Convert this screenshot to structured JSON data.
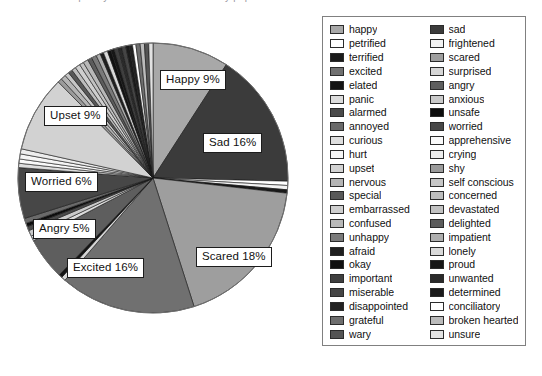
{
  "chart_data": {
    "type": "pie",
    "title": "Frequency of emotion words used by pupils",
    "legend_position": "right",
    "legend_columns": 2,
    "start_angle_deg": -90,
    "direction": "clockwise",
    "labels_shown": [
      {
        "name": "Happy 9%",
        "category": "happy",
        "value": 9
      },
      {
        "name": "Sad 16%",
        "category": "sad",
        "value": 16
      },
      {
        "name": "Scared 18%",
        "category": "scared",
        "value": 18
      },
      {
        "name": "Excited 16%",
        "category": "excited",
        "value": 16
      },
      {
        "name": "Angry 5%",
        "category": "angry",
        "value": 5
      },
      {
        "name": "Worried 6%",
        "category": "worried",
        "value": 6
      },
      {
        "name": "Upset 9%",
        "category": "upset",
        "value": 9
      }
    ],
    "categories": [
      "happy",
      "sad",
      "petrified",
      "frightened",
      "terrified",
      "scared",
      "excited",
      "surprised",
      "elated",
      "angry",
      "panic",
      "anxious",
      "alarmed",
      "unsafe",
      "annoyed",
      "worried",
      "curious",
      "apprehensive",
      "hurt",
      "crying",
      "upset",
      "shy",
      "nervous",
      "self conscious",
      "special",
      "concerned",
      "embarrassed",
      "devastated",
      "confused",
      "delighted",
      "unhappy",
      "impatient",
      "afraid",
      "lonely",
      "okay",
      "proud",
      "important",
      "unwanted",
      "miserable",
      "determined",
      "disappointed",
      "conciliatory",
      "grateful",
      "broken hearted",
      "wary",
      "unsure"
    ],
    "values": [
      9.0,
      16.0,
      0.5,
      0.5,
      0.4,
      18.0,
      16.0,
      0.5,
      0.4,
      5.0,
      0.6,
      0.7,
      0.5,
      0.4,
      0.6,
      6.0,
      0.5,
      0.5,
      0.6,
      0.6,
      9.0,
      0.5,
      0.6,
      0.5,
      0.5,
      0.5,
      0.6,
      0.5,
      0.6,
      0.5,
      0.6,
      0.5,
      0.4,
      0.5,
      0.4,
      0.4,
      0.5,
      0.4,
      0.5,
      0.4,
      0.4,
      0.4,
      0.5,
      0.5,
      0.5,
      0.5
    ],
    "colors": [
      "#a8a8a8",
      "#3b3b3b",
      "#ffffff",
      "#f2f2f2",
      "#1a1a1a",
      "#9e9e9e",
      "#707070",
      "#d6d6d6",
      "#141414",
      "#5e5e5e",
      "#dcdcdc",
      "#cacaca",
      "#4a4a4a",
      "#0d0d0d",
      "#6a6a6a",
      "#474747",
      "#dedede",
      "#fafafa",
      "#f5f5f5",
      "#ededed",
      "#d2d2d2",
      "#9b9b9b",
      "#b4b4b4",
      "#c6c6c6",
      "#585858",
      "#bdbdbd",
      "#cfcfcf",
      "#c2c2c2",
      "#b8b8b8",
      "#5c5c5c",
      "#7a7a7a",
      "#aeaeae",
      "#1f1f1f",
      "#d9d9d9",
      "#111111",
      "#171717",
      "#3f3f3f",
      "#2a2a2a",
      "#454545",
      "#1b1b1b",
      "#222222",
      "#ffffff",
      "#6e6e6e",
      "#bbbbbb",
      "#545454",
      "#e2e2e2"
    ]
  },
  "legend": {
    "left_column": [
      {
        "label": "happy",
        "color": "#a8a8a8"
      },
      {
        "label": "petrified",
        "color": "#ffffff"
      },
      {
        "label": "terrified",
        "color": "#1a1a1a"
      },
      {
        "label": "excited",
        "color": "#707070"
      },
      {
        "label": "elated",
        "color": "#141414"
      },
      {
        "label": "panic",
        "color": "#dcdcdc"
      },
      {
        "label": "alarmed",
        "color": "#4a4a4a"
      },
      {
        "label": "annoyed",
        "color": "#6a6a6a"
      },
      {
        "label": "curious",
        "color": "#dedede"
      },
      {
        "label": "hurt",
        "color": "#f5f5f5"
      },
      {
        "label": "upset",
        "color": "#d2d2d2"
      },
      {
        "label": "nervous",
        "color": "#b4b4b4"
      },
      {
        "label": "special",
        "color": "#585858"
      },
      {
        "label": "embarrassed",
        "color": "#cfcfcf"
      },
      {
        "label": "confused",
        "color": "#b8b8b8"
      },
      {
        "label": "unhappy",
        "color": "#7a7a7a"
      },
      {
        "label": "afraid",
        "color": "#1f1f1f"
      },
      {
        "label": "okay",
        "color": "#111111"
      },
      {
        "label": "important",
        "color": "#3f3f3f"
      },
      {
        "label": "miserable",
        "color": "#454545"
      },
      {
        "label": "disappointed",
        "color": "#222222"
      },
      {
        "label": "grateful",
        "color": "#6e6e6e"
      },
      {
        "label": "wary",
        "color": "#545454"
      }
    ],
    "right_column": [
      {
        "label": "sad",
        "color": "#3b3b3b"
      },
      {
        "label": "frightened",
        "color": "#f2f2f2"
      },
      {
        "label": "scared",
        "color": "#9e9e9e"
      },
      {
        "label": "surprised",
        "color": "#d6d6d6"
      },
      {
        "label": "angry",
        "color": "#5e5e5e"
      },
      {
        "label": "anxious",
        "color": "#cacaca"
      },
      {
        "label": "unsafe",
        "color": "#0d0d0d"
      },
      {
        "label": "worried",
        "color": "#474747"
      },
      {
        "label": "apprehensive",
        "color": "#fafafa"
      },
      {
        "label": "crying",
        "color": "#ededed"
      },
      {
        "label": "shy",
        "color": "#9b9b9b"
      },
      {
        "label": "self conscious",
        "color": "#c6c6c6"
      },
      {
        "label": "concerned",
        "color": "#bdbdbd"
      },
      {
        "label": "devastated",
        "color": "#c2c2c2"
      },
      {
        "label": "delighted",
        "color": "#5c5c5c"
      },
      {
        "label": "impatient",
        "color": "#aeaeae"
      },
      {
        "label": "lonely",
        "color": "#d9d9d9"
      },
      {
        "label": "proud",
        "color": "#171717"
      },
      {
        "label": "unwanted",
        "color": "#2a2a2a"
      },
      {
        "label": "determined",
        "color": "#1b1b1b"
      },
      {
        "label": "conciliatory",
        "color": "#ffffff"
      },
      {
        "label": "broken hearted",
        "color": "#bbbbbb"
      },
      {
        "label": "unsure",
        "color": "#e2e2e2"
      }
    ]
  },
  "pie_labels": [
    {
      "text": "Happy 9%",
      "x": 160,
      "y": 70
    },
    {
      "text": "Sad 16%",
      "x": 203,
      "y": 133
    },
    {
      "text": "Scared 18%",
      "x": 196,
      "y": 247
    },
    {
      "text": "Excited 16%",
      "x": 67,
      "y": 258
    },
    {
      "text": "Angry 5%",
      "x": 33,
      "y": 219
    },
    {
      "text": "Worried 6%",
      "x": 25,
      "y": 172
    },
    {
      "text": "Upset 9%",
      "x": 44,
      "y": 106
    }
  ],
  "geometry": {
    "cx": 153,
    "cy": 178,
    "r": 135
  }
}
